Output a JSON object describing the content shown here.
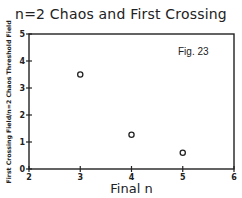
{
  "chart_data": {
    "type": "scatter",
    "title": "n=2 Chaos and First Crossing",
    "xlabel": "Final n",
    "ylabel": "First Crossing Field/n=2 Chaos Threshold Field",
    "annotation": "Fig. 23",
    "xlim": [
      2,
      6
    ],
    "ylim": [
      0,
      5
    ],
    "x_ticks": [
      "2",
      "3",
      "4",
      "5",
      "6"
    ],
    "y_ticks": [
      "0",
      "1",
      "2",
      "3",
      "4",
      "5"
    ],
    "grid": false,
    "legend": null,
    "marker": "open-circle",
    "series": [
      {
        "name": "data",
        "x": [
          3,
          4,
          5
        ],
        "y": [
          3.5,
          1.27,
          0.6
        ]
      }
    ]
  }
}
